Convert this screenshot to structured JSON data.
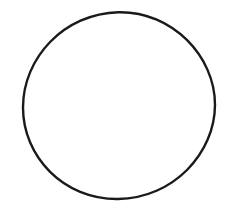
{
  "canvas": {
    "width": 232,
    "height": 212,
    "background_color": "#ffffff",
    "description": "blank white page containing a single hand-drawn circle outline",
    "visible_text": "",
    "label_count": 0
  },
  "figure": {
    "name": "circle",
    "kind": "closed-curve-outline",
    "fill": "none",
    "stroke_color": "#1a1a1a",
    "stroke_width": 2.4,
    "center_x": 119,
    "center_y": 105.5,
    "radius_x": 96,
    "radius_y": 93.5,
    "bounds": {
      "left": 23,
      "top": 12,
      "right": 215,
      "bottom": 199
    },
    "hand_drawn": true,
    "path": "M 23.0 107.5 C 23.0 58.0 64.0 13.5 118.5 12.2 C 172.0 11.0 215.2 56.5 215.0 105.0 C 214.8 153.0 173.5 198.3 118.0 199.0 C 63.5 199.6 23.0 156.5 23.0 107.5 Z"
  }
}
